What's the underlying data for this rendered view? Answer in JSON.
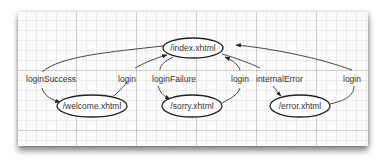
{
  "diagram": {
    "type": "navigation-flow",
    "nodes": [
      {
        "id": "index",
        "label": "/index.xhtml",
        "cx": 193,
        "cy": 48,
        "rx": 30,
        "ry": 10
      },
      {
        "id": "welcome",
        "label": "/welcome.xhtml",
        "cx": 92,
        "cy": 106,
        "rx": 35,
        "ry": 11
      },
      {
        "id": "sorry",
        "label": "/sorry.xhtml",
        "cx": 192,
        "cy": 106,
        "rx": 30,
        "ry": 11
      },
      {
        "id": "error",
        "label": "/error.xhtml",
        "cx": 300,
        "cy": 106,
        "rx": 30,
        "ry": 11
      }
    ],
    "edges": [
      {
        "from": "index",
        "to": "welcome",
        "label": "loginSuccess"
      },
      {
        "from": "welcome",
        "to": "index",
        "label": "login"
      },
      {
        "from": "index",
        "to": "sorry",
        "label": "loginFailure"
      },
      {
        "from": "sorry",
        "to": "index",
        "label": "login"
      },
      {
        "from": "index",
        "to": "error",
        "label": "internalError"
      },
      {
        "from": "error",
        "to": "index",
        "label": "login"
      }
    ]
  }
}
